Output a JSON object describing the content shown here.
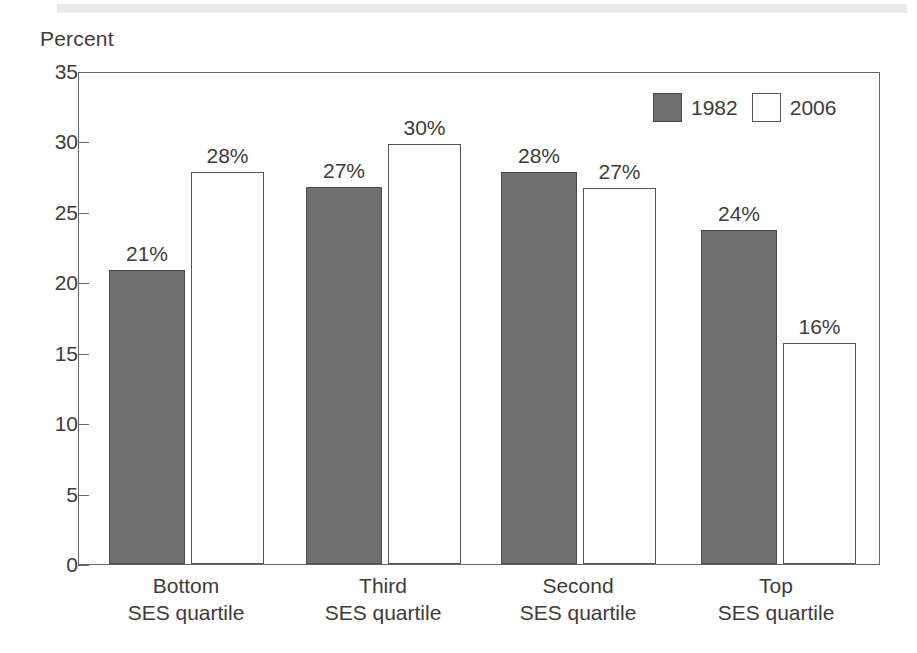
{
  "figure": {
    "axis_title": "Percent"
  },
  "legend": {
    "entries": [
      {
        "label": "1982",
        "swatch": "dark-gray-filled-square",
        "color": "#6f6f6f"
      },
      {
        "label": "2006",
        "swatch": "white-outlined-square",
        "color": "#ffffff"
      }
    ]
  },
  "y_axis": {
    "ticks": [
      "35",
      "30",
      "25",
      "20",
      "15",
      "10",
      "5",
      "0"
    ]
  },
  "x_axis": {
    "groups": [
      {
        "line1": "Bottom",
        "line2": "SES quartile"
      },
      {
        "line1": "Third",
        "line2": "SES quartile"
      },
      {
        "line1": "Second",
        "line2": "SES quartile"
      },
      {
        "line1": "Top",
        "line2": "SES quartile"
      }
    ]
  },
  "bars": [
    {
      "group": 0,
      "series": "1982",
      "label": "21%",
      "value": 20.9
    },
    {
      "group": 0,
      "series": "2006",
      "label": "28%",
      "value": 27.8
    },
    {
      "group": 1,
      "series": "1982",
      "label": "27%",
      "value": 26.8
    },
    {
      "group": 1,
      "series": "2006",
      "label": "30%",
      "value": 29.8
    },
    {
      "group": 2,
      "series": "1982",
      "label": "28%",
      "value": 27.8
    },
    {
      "group": 2,
      "series": "2006",
      "label": "27%",
      "value": 26.7
    },
    {
      "group": 3,
      "series": "1982",
      "label": "24%",
      "value": 23.7
    },
    {
      "group": 3,
      "series": "2006",
      "label": "16%",
      "value": 15.7
    }
  ],
  "chart_data": {
    "type": "bar",
    "title": "",
    "subtitle": "",
    "xlabel": "",
    "ylabel": "Percent",
    "categories": [
      "Bottom SES quartile",
      "Third SES quartile",
      "Second SES quartile",
      "Top SES quartile"
    ],
    "series": [
      {
        "name": "1982",
        "values": [
          20.9,
          26.8,
          27.8,
          23.7
        ],
        "data_labels": [
          "21%",
          "27%",
          "28%",
          "24%"
        ],
        "color": "#6f6f6f",
        "style": "filled dark gray"
      },
      {
        "name": "2006",
        "values": [
          27.8,
          29.8,
          26.7,
          15.7
        ],
        "data_labels": [
          "28%",
          "30%",
          "27%",
          "16%"
        ],
        "color": "#ffffff",
        "style": "white with dark outline"
      }
    ],
    "ylim": [
      0,
      35
    ],
    "ytick_step": 5,
    "yticks": [
      0,
      5,
      10,
      15,
      20,
      25,
      30,
      35
    ],
    "ytick_labels": [
      "0",
      "5",
      "10",
      "15",
      "20",
      "25",
      "30",
      "35"
    ],
    "grid": false,
    "legend_position": "top-right inside plot area",
    "value_labels_shown": true,
    "units": "percent"
  }
}
